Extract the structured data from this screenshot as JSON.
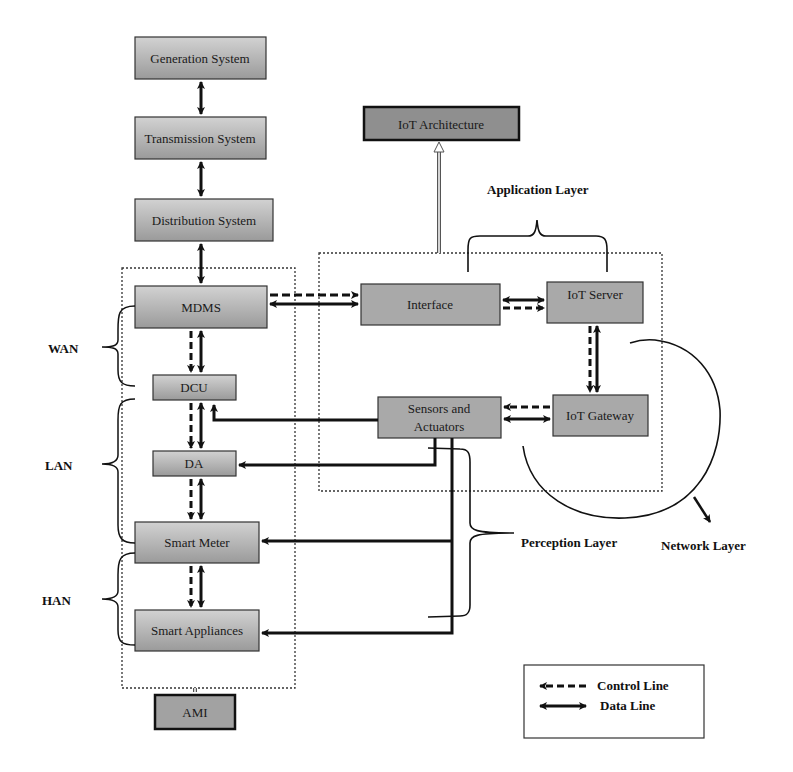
{
  "colors": {
    "box_gradient_top": "#c9c9c9",
    "box_gradient_bottom": "#9c9c9c",
    "flat_box": "#a9a9a9",
    "dark_box": "#8f8f8f",
    "stroke": "#111111"
  },
  "grid_chain": {
    "generation": "Generation System",
    "transmission": "Transmission System",
    "distribution": "Distribution System"
  },
  "ami": {
    "mdms": "MDMS",
    "dcu": "DCU",
    "da": "DA",
    "smart_meter": "Smart Meter",
    "smart_appliances": "Smart Appliances",
    "ami_box": "AMI"
  },
  "network_labels": {
    "wan": "WAN",
    "lan": "LAN",
    "han": "HAN"
  },
  "iot": {
    "architecture": "IoT Architecture",
    "interface": "Interface",
    "iot_server": "IoT Server",
    "sensors_line1": "Sensors and",
    "sensors_line2": "Actuators",
    "iot_gateway": "IoT Gateway"
  },
  "layers": {
    "application": "Application Layer",
    "perception": "Perception Layer",
    "network": "Network Layer"
  },
  "legend": {
    "control": "Control Line",
    "data": "Data Line"
  }
}
